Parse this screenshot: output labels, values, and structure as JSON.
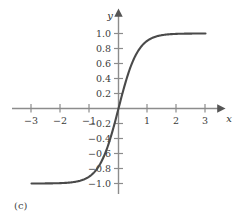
{
  "figure": {
    "panel_label": "(c)",
    "background_color": "#ffffff",
    "curve_color": "#4a4a4a",
    "axis_color": "#8c8c8c",
    "text_color": "#3b3b3b"
  },
  "chart_data": {
    "type": "line",
    "title": "",
    "subtitle": "",
    "xlabel": "x",
    "ylabel": "y",
    "xlim": [
      -3.4,
      3.4
    ],
    "ylim": [
      -1.2,
      1.2
    ],
    "grid": false,
    "legend": null,
    "annotations": [
      "(c)"
    ],
    "x_ticks": [
      -3,
      -2,
      -1,
      1,
      2,
      3
    ],
    "x_tick_labels": [
      "−3",
      "−2",
      "−1",
      "1",
      "2",
      "3"
    ],
    "y_ticks": [
      1.0,
      0.8,
      0.6,
      0.4,
      0.2,
      -0.2,
      -0.4,
      -0.6,
      -0.8,
      -1.0
    ],
    "y_tick_labels": [
      "1.0",
      "0.8",
      "0.6",
      "0.4",
      "0.2",
      "−0.2",
      "−0.4",
      "−0.6",
      "−0.8",
      "−1.0"
    ],
    "series": [
      {
        "name": "sigmoid",
        "x": [
          -3.0,
          -2.8,
          -2.6,
          -2.4,
          -2.2,
          -2.0,
          -1.8,
          -1.6,
          -1.4,
          -1.2,
          -1.0,
          -0.8,
          -0.6,
          -0.4,
          -0.2,
          0.0,
          0.2,
          0.4,
          0.6,
          0.8,
          1.0,
          1.2,
          1.4,
          1.6,
          1.8,
          2.0,
          2.2,
          2.4,
          2.6,
          2.8,
          3.0
        ],
        "y": [
          -0.9993,
          -0.9988,
          -0.9981,
          -0.9969,
          -0.9951,
          -0.9217,
          -0.9801,
          -0.9684,
          -0.9501,
          -0.9217,
          -0.8779,
          -0.8109,
          -0.7136,
          -0.537,
          -0.2913,
          0.0,
          0.2913,
          0.537,
          0.7136,
          0.8109,
          0.8779,
          0.9217,
          0.9501,
          0.9684,
          0.9801,
          0.9874,
          0.9921,
          0.9951,
          0.9969,
          0.9981,
          0.9993
        ]
      }
    ]
  }
}
